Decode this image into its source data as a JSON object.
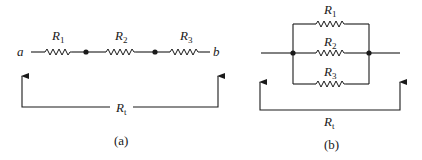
{
  "figure": {
    "stroke_color": "#1a1a1a",
    "background": "#ffffff"
  },
  "series_circuit": {
    "caption": "(a)",
    "terminal_left": "a",
    "terminal_right": "b",
    "resistors": [
      {
        "name": "R",
        "sub": "1"
      },
      {
        "name": "R",
        "sub": "2"
      },
      {
        "name": "R",
        "sub": "3"
      }
    ],
    "total_label": {
      "name": "R",
      "sub": "t"
    },
    "junction_count": 2
  },
  "parallel_circuit": {
    "caption": "(b)",
    "resistors": [
      {
        "name": "R",
        "sub": "1"
      },
      {
        "name": "R",
        "sub": "2"
      },
      {
        "name": "R",
        "sub": "3"
      }
    ],
    "total_label": {
      "name": "R",
      "sub": "t"
    },
    "junction_count": 2
  }
}
